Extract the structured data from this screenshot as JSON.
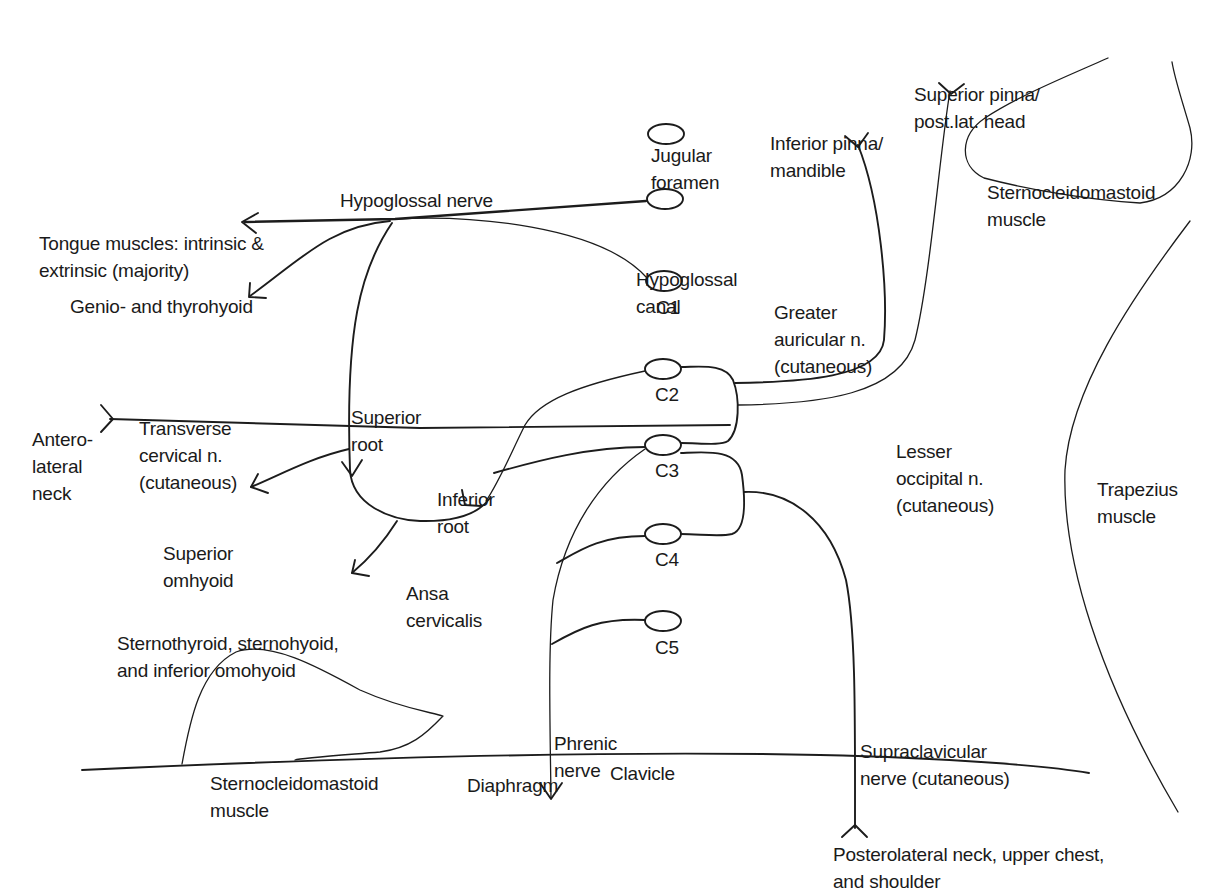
{
  "diagram": {
    "topic": "Cervical plexus and hypoglossal nerve",
    "colors": {
      "ink": "#1c1c1c",
      "background": "#ffffff"
    },
    "landmarks": {
      "jugular_foramen": [
        "Jugular",
        "foramen"
      ],
      "hypoglossal_canal": [
        "Hypoglossal",
        "canal"
      ],
      "sternocleidomastoid_upper": [
        "Sternocleidomastoid",
        "muscle"
      ],
      "sternocleidomastoid_lower": [
        "Sternocleidomastoid",
        "muscle"
      ],
      "trapezius": [
        "Trapezius",
        "muscle"
      ],
      "clavicle": "Clavicle"
    },
    "spinal_roots": [
      "C1",
      "C2",
      "C3",
      "C4",
      "C5"
    ],
    "nerves": {
      "hypoglossal": "Hypoglossal nerve",
      "superior_root": [
        "Superior",
        "root"
      ],
      "inferior_root": [
        "Inferior",
        "root"
      ],
      "ansa_cervicalis": [
        "Ansa",
        "cervicalis"
      ],
      "transverse_cervical": [
        "Transverse",
        "cervical n.",
        "(cutaneous)"
      ],
      "greater_auricular": [
        "Greater",
        "auricular n.",
        "(cutaneous)"
      ],
      "lesser_occipital": [
        "Lesser",
        "occipital n.",
        "(cutaneous)"
      ],
      "phrenic": [
        "Phrenic",
        "nerve"
      ],
      "supraclavicular": [
        "Supraclavicular",
        "nerve (cutaneous)"
      ]
    },
    "targets": {
      "tongue_muscles": [
        "Tongue muscles: intrinsic &",
        "extrinsic (majority)"
      ],
      "genio_thyrohyoid": "Genio- and thyrohyoid",
      "superior_omohyoid": [
        "Superior",
        "omhyoid"
      ],
      "infrahyoid_group": [
        "Sternothyroid, sternohyoid,",
        "and inferior omohyoid"
      ],
      "anterolateral_neck": [
        "Antero-",
        "lateral",
        "neck"
      ],
      "inferior_pinna": [
        "Inferior pinna/",
        "mandible"
      ],
      "superior_pinna": [
        "Superior pinna/",
        "post.lat. head"
      ],
      "diaphragm": "Diaphragm",
      "posterolateral": [
        "Posterolateral neck, upper chest,",
        "and shoulder"
      ]
    }
  }
}
